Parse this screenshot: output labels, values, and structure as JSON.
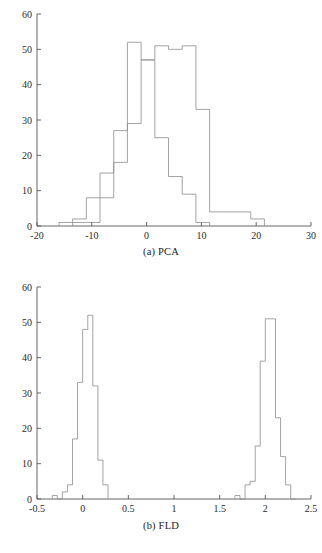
{
  "page": {
    "background": "#ffffff",
    "axis_color": "#555555",
    "hist_color": "#8c8c8c"
  },
  "figures": [
    {
      "id": "pca",
      "caption": "(a) PCA"
    },
    {
      "id": "fld",
      "caption": "(b) FLD"
    }
  ],
  "chart_data": [
    {
      "type": "bar",
      "subtype": "histogram-step-outline",
      "id": "pca",
      "title": "",
      "caption": "(a) PCA",
      "xlabel": "",
      "ylabel": "",
      "xlim": [
        -20,
        30
      ],
      "ylim": [
        0,
        60
      ],
      "xticks": [
        -20,
        -10,
        0,
        10,
        20,
        30
      ],
      "xtick_labels": [
        "-20",
        "-10",
        "0",
        "10",
        "20",
        "30"
      ],
      "yticks": [
        0,
        10,
        20,
        30,
        40,
        50,
        60
      ],
      "ytick_labels": [
        "0",
        "10",
        "20",
        "30",
        "40",
        "50",
        "60"
      ],
      "grid": false,
      "legend": false,
      "bin_width": 2.5,
      "series": [
        {
          "name": "class-1",
          "bin_edges": [
            -16.0,
            -13.5,
            -11.0,
            -8.5,
            -6.0,
            -3.5,
            -1.0,
            1.5,
            4.0,
            6.5,
            9.0,
            11.5
          ],
          "values": [
            1,
            2,
            8,
            15,
            27,
            52,
            47,
            25,
            14,
            9,
            1
          ]
        },
        {
          "name": "class-2",
          "bin_edges": [
            -13.5,
            -11.0,
            -8.5,
            -6.0,
            -3.5,
            -1.0,
            1.5,
            4.0,
            6.5,
            9.0,
            11.5,
            14.0,
            16.5,
            19.0,
            21.5
          ],
          "values": [
            1,
            1,
            8,
            18,
            29,
            47,
            51,
            50,
            51,
            33,
            4,
            4,
            4,
            2
          ]
        }
      ]
    },
    {
      "type": "bar",
      "subtype": "histogram-step-outline",
      "id": "fld",
      "title": "",
      "caption": "(b) FLD",
      "xlabel": "",
      "ylabel": "",
      "xlim": [
        -0.5,
        2.5
      ],
      "ylim": [
        0,
        60
      ],
      "xticks": [
        -0.5,
        0,
        0.5,
        1,
        1.5,
        2,
        2.5
      ],
      "xtick_labels": [
        "-0.5",
        "0",
        "0.5",
        "1",
        "1.5",
        "2",
        "2.5"
      ],
      "yticks": [
        0,
        10,
        20,
        30,
        40,
        50,
        60
      ],
      "ytick_labels": [
        "0",
        "10",
        "20",
        "30",
        "40",
        "50",
        "60"
      ],
      "grid": false,
      "legend": false,
      "bin_width": 0.0556,
      "series": [
        {
          "name": "class-1",
          "bin_edges": [
            -0.333,
            -0.278,
            -0.222,
            -0.167,
            -0.111,
            -0.056,
            0.0,
            0.056,
            0.111,
            0.167,
            0.222,
            0.278
          ],
          "values": [
            1,
            0,
            2,
            4,
            17,
            33,
            48,
            52,
            32,
            11,
            4
          ]
        },
        {
          "name": "class-2",
          "bin_edges": [
            1.667,
            1.722,
            1.778,
            1.833,
            1.889,
            1.944,
            2.0,
            2.056,
            2.111,
            2.167,
            2.222,
            2.278,
            2.333
          ],
          "values": [
            1,
            0,
            4,
            5,
            15,
            39,
            51,
            51,
            23,
            12,
            4,
            0
          ]
        }
      ]
    }
  ]
}
